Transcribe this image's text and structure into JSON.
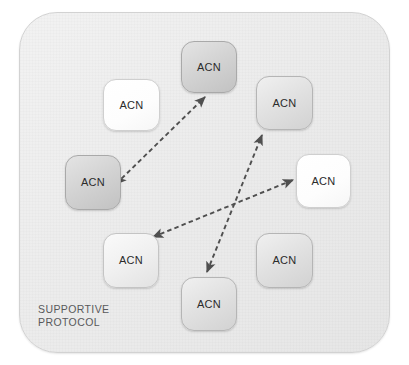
{
  "diagram": {
    "container": {
      "name": "supportive-protocol-container",
      "caption_line1": "SUPPORTIVE",
      "caption_line2": "PROTOCOL",
      "background_color": "#ececec",
      "border_color": "#d2d2d2"
    },
    "node_label_default": "ACN",
    "nodes": [
      {
        "id": "acn-top",
        "label": "ACN",
        "x": 181,
        "y": 41,
        "w": 56,
        "h": 52,
        "tone": "dark"
      },
      {
        "id": "acn-upper-left",
        "label": "ACN",
        "x": 103,
        "y": 79,
        "w": 57,
        "h": 52,
        "tone": "white"
      },
      {
        "id": "acn-upper-right",
        "label": "ACN",
        "x": 256,
        "y": 76,
        "w": 57,
        "h": 54,
        "tone": "mid"
      },
      {
        "id": "acn-mid-left",
        "label": "ACN",
        "x": 65,
        "y": 155,
        "w": 56,
        "h": 55,
        "tone": "dark"
      },
      {
        "id": "acn-mid-right",
        "label": "ACN",
        "x": 296,
        "y": 154,
        "w": 55,
        "h": 54,
        "tone": "white"
      },
      {
        "id": "acn-lower-left",
        "label": "ACN",
        "x": 103,
        "y": 233,
        "w": 56,
        "h": 55,
        "tone": "light"
      },
      {
        "id": "acn-bottom",
        "label": "ACN",
        "x": 181,
        "y": 277,
        "w": 56,
        "h": 54,
        "tone": "mid"
      },
      {
        "id": "acn-lower-right",
        "label": "ACN",
        "x": 256,
        "y": 233,
        "w": 57,
        "h": 55,
        "tone": "mid"
      }
    ],
    "connections": [
      {
        "id": "link-midleft-top",
        "from": "acn-mid-left",
        "to": "acn-top",
        "style": "dashed",
        "direction": "bidirectional",
        "x1": 116,
        "y1": 184,
        "x2": 205,
        "y2": 97,
        "color": "#5a5a5a"
      },
      {
        "id": "link-bottom-upperright",
        "from": "acn-bottom",
        "to": "acn-upper-right",
        "style": "dashed",
        "direction": "bidirectional",
        "x1": 207,
        "y1": 272,
        "x2": 262,
        "y2": 135,
        "color": "#5a5a5a"
      },
      {
        "id": "link-lowerleft-midright",
        "from": "acn-lower-left",
        "to": "acn-mid-right",
        "style": "dashed",
        "direction": "bidirectional",
        "x1": 153,
        "y1": 237,
        "x2": 293,
        "y2": 180,
        "color": "#5a5a5a"
      }
    ]
  }
}
